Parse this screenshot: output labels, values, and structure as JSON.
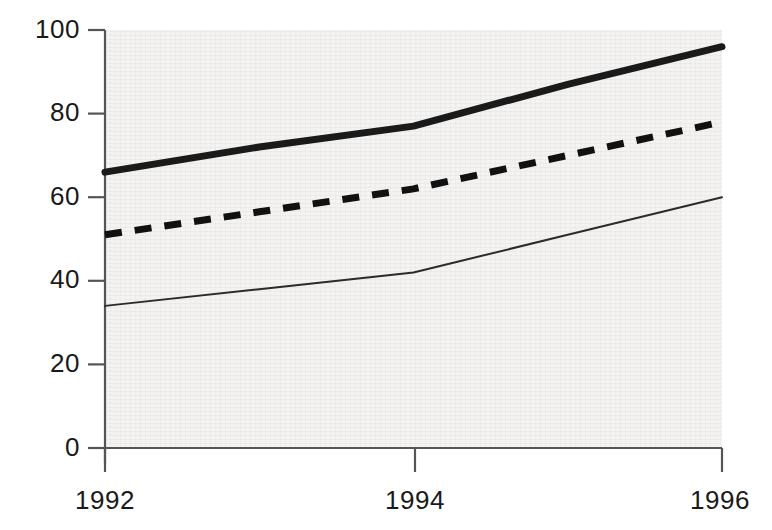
{
  "chart_data": {
    "type": "line",
    "title": "",
    "subtitle": "",
    "xlabel": "",
    "ylabel": "",
    "x": [
      1992,
      1993,
      1994,
      1995,
      1996
    ],
    "xtick_labels": [
      "1992",
      "1994",
      "1996"
    ],
    "xtick_values": [
      1992,
      1994,
      1996
    ],
    "ytick_labels": [
      "0",
      "20",
      "40",
      "60",
      "80",
      "100"
    ],
    "ytick_values": [
      0,
      20,
      40,
      60,
      80,
      100
    ],
    "xlim": [
      1992,
      1996
    ],
    "ylim": [
      0,
      100
    ],
    "grid": false,
    "legend": "none",
    "series": [
      {
        "name": "thick-solid-series",
        "style": "solid",
        "line_width": 7,
        "color": "#1a1a1a",
        "values": [
          66,
          72,
          77,
          87,
          96
        ]
      },
      {
        "name": "dashed-series",
        "style": "dashed",
        "line_width": 7,
        "color": "#111111",
        "values": [
          51,
          56.5,
          62,
          70,
          78
        ]
      },
      {
        "name": "thin-solid-series",
        "style": "solid",
        "line_width": 2,
        "color": "#2b2b2b",
        "values": [
          34,
          38,
          42,
          51,
          60
        ]
      }
    ],
    "annotations": []
  },
  "axes": {
    "y_axis_name": "y-axis",
    "x_axis_name": "x-axis",
    "axis_color": "#555555",
    "plot_bg_color": "#f4f3f2"
  },
  "ylabels": {
    "t0": "100",
    "t1": "80",
    "t2": "60",
    "t3": "40",
    "t4": "20",
    "t5": "0"
  },
  "xlabels": {
    "t0": "1992",
    "t1": "1994",
    "t2": "1996"
  }
}
